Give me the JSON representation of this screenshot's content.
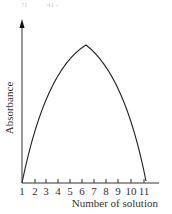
{
  "scribbles": [
    "?1",
    "41 -"
  ],
  "chart_data": {
    "type": "line",
    "title": "",
    "xlabel": "Number of solution",
    "ylabel": "Absorbance",
    "categories": [
      "1",
      "2",
      "3",
      "4",
      "5",
      "6",
      "7",
      "8",
      "9",
      "10",
      "11"
    ],
    "x": [
      1,
      2,
      3,
      4,
      5,
      6,
      7,
      8,
      9,
      10,
      11
    ],
    "series": [
      {
        "name": "Absorbance",
        "values": [
          0,
          0.42,
          0.68,
          0.86,
          0.96,
          1.0,
          0.93,
          0.8,
          0.6,
          0.35,
          0.02
        ]
      }
    ],
    "shape": "inverted-V curve (concave segments) peaking at solution 6",
    "ylim": [
      0,
      1
    ],
    "y_ticks": "none (arrow axis, unlabeled)",
    "grid": false,
    "legend": "none"
  }
}
